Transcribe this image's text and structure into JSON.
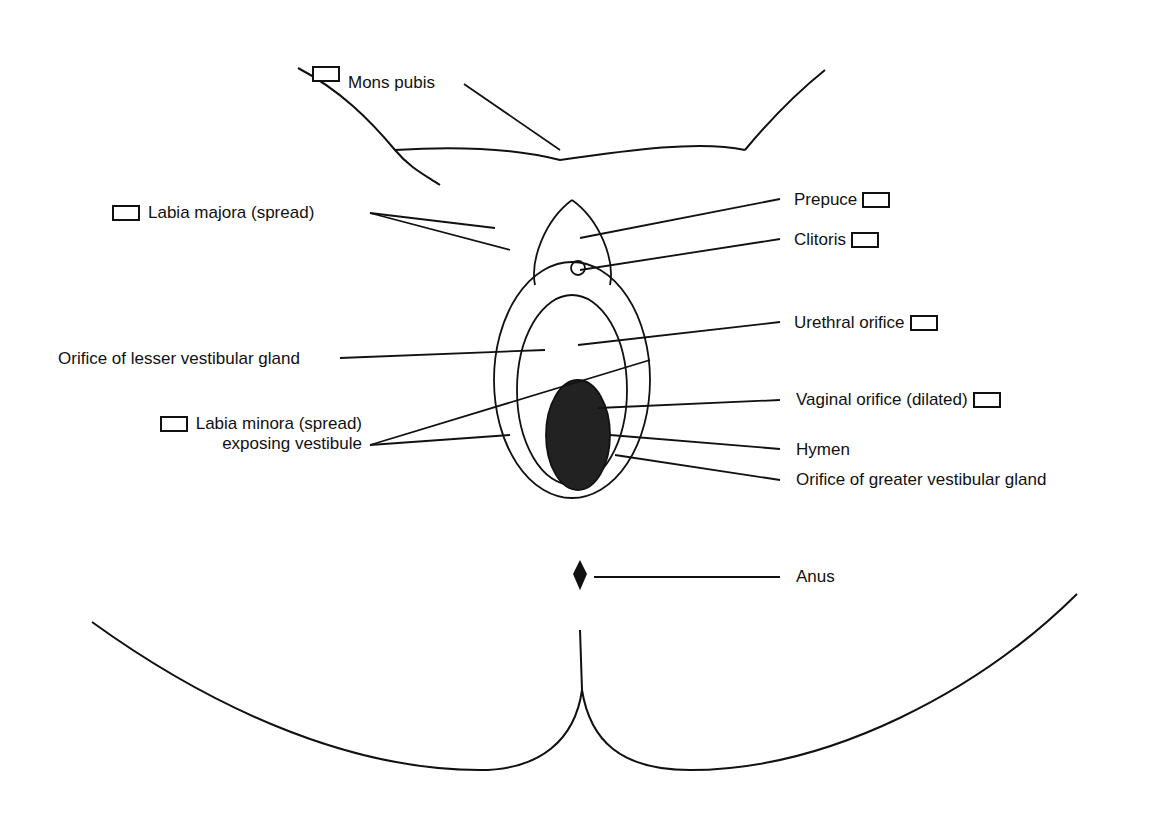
{
  "diagram": {
    "labels": {
      "mons_pubis": "Mons pubis",
      "labia_majora": "Labia majora (spread)",
      "prepuce": "Prepuce",
      "clitoris": "Clitoris",
      "urethral_orifice": "Urethral orifice",
      "lesser_gland": "Orifice of lesser vestibular gland",
      "labia_minora_line1": "Labia minora (spread)",
      "labia_minora_line2": "exposing vestibule",
      "vaginal_orifice": "Vaginal orifice (dilated)",
      "hymen": "Hymen",
      "greater_gland": "Orifice of greater vestibular gland",
      "anus": "Anus"
    },
    "checkboxes": [
      "mons_pubis",
      "labia_majora",
      "prepuce",
      "clitoris",
      "urethral_orifice",
      "labia_minora",
      "vaginal_orifice"
    ],
    "line_color": "#111111",
    "background": "#ffffff"
  }
}
